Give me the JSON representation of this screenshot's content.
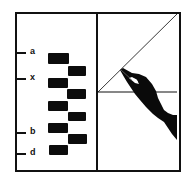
{
  "figure": {
    "left_panel": {
      "axis_labels": [
        {
          "text": "a",
          "y": 52
        },
        {
          "text": "x",
          "y": 78
        },
        {
          "text": "b",
          "y": 132
        },
        {
          "text": "d",
          "y": 153
        }
      ],
      "blocks": [
        {
          "column": "left",
          "top": 53,
          "height": 11
        },
        {
          "column": "right",
          "top": 66,
          "height": 10
        },
        {
          "column": "left",
          "top": 78,
          "height": 10
        },
        {
          "column": "right",
          "top": 89,
          "height": 10
        },
        {
          "column": "left",
          "top": 101,
          "height": 10
        },
        {
          "column": "right",
          "top": 112,
          "height": 9
        },
        {
          "column": "left",
          "top": 123,
          "height": 10
        },
        {
          "column": "right",
          "top": 134,
          "height": 10
        },
        {
          "column": "left",
          "top": 145,
          "height": 10
        }
      ]
    },
    "right_panel": {
      "elements": [
        "diagonal-line",
        "horizontal-line",
        "hand-silhouette"
      ]
    },
    "colors": {
      "ink": "#111111",
      "background": "#ffffff"
    }
  }
}
